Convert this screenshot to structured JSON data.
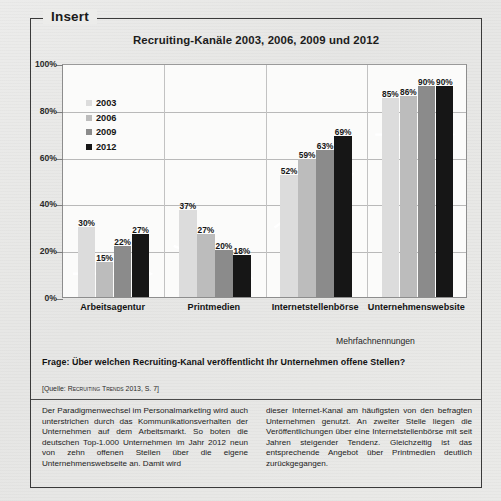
{
  "insert": {
    "label": "Insert"
  },
  "chart_data": {
    "type": "bar",
    "title": "Recruiting-Kanäle 2003, 2006, 2009 und 2012",
    "xlabel": "",
    "ylabel": "",
    "ylim": [
      0,
      100
    ],
    "yticks": [
      "0%",
      "20%",
      "40%",
      "60%",
      "80%",
      "100%"
    ],
    "ytick_values": [
      0,
      20,
      40,
      60,
      80,
      100
    ],
    "grid": true,
    "legend_position": "upper-left-inside",
    "categories": [
      "Arbeitsagentur",
      "Printmedien",
      "Internetstellenbörse",
      "Unternehmenswebsite"
    ],
    "series": [
      {
        "name": "2003",
        "color": "#dcdcdc",
        "values": [
          30,
          37,
          52,
          85
        ],
        "labels": [
          "30%",
          "37%",
          "52%",
          "85%"
        ]
      },
      {
        "name": "2006",
        "color": "#bcbcbc",
        "values": [
          15,
          27,
          59,
          86
        ],
        "labels": [
          "15%",
          "27%",
          "59%",
          "86%"
        ]
      },
      {
        "name": "2009",
        "color": "#8b8b8b",
        "values": [
          22,
          20,
          63,
          90
        ],
        "labels": [
          "22%",
          "20%",
          "63%",
          "90%"
        ]
      },
      {
        "name": "2012",
        "color": "#161616",
        "values": [
          27,
          18,
          69,
          90
        ],
        "labels": [
          "27%",
          "18%",
          "69%",
          "90%"
        ]
      }
    ],
    "trend_arrows": [
      {
        "group": "Arbeitsagentur",
        "from": 10,
        "to": 10,
        "direction": "flat",
        "color": "#ffffff"
      },
      {
        "group": "Printmedien",
        "from": 22,
        "to": 8,
        "direction": "down",
        "color": "#ffffff"
      },
      {
        "group": "Internetstellenbörse",
        "from": 30,
        "to": 53,
        "direction": "up",
        "color": "#ffffff"
      },
      {
        "group": "Unternehmenswebsite",
        "from": 70,
        "to": 70,
        "direction": "flat",
        "color": "#ffffff"
      }
    ],
    "annotation": "Mehrfachnennungen"
  },
  "question": "Frage: Über welchen Recruiting-Kanal veröffentlicht Ihr Unternehmen offene Stellen?",
  "source": {
    "open": "[Quelle: ",
    "smallcaps": "Recruiting Trends",
    "close": " 2013, S. 7]"
  },
  "body": {
    "left": "Der Paradigmenwechsel im Personalmarketing wird auch unterstrichen durch das Kommunikationsverhalten der Unternehmen auf dem Arbeitsmarkt. So boten die deutschen Top-1.000 Unternehmen im Jahr 2012 neun von zehn offenen Stellen über die eigene Unternehmenswebseite an. Damit wird",
    "right": "dieser Internet-Kanal am häufigsten von den befragten Unternehmen genutzt. An zweiter Stelle liegen die Veröffentlichungen über eine Internetstellenbörse mit seit Jahren steigender Tendenz. Gleichzeitig ist das entsprechende Angebot über Printmedien deutlich zurückgegangen."
  }
}
